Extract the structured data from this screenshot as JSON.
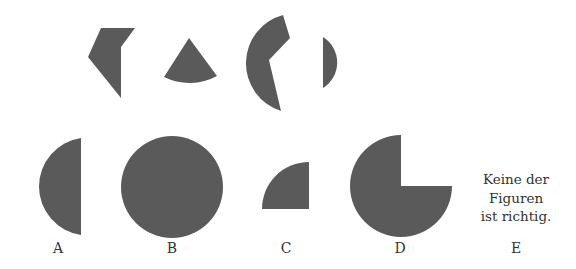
{
  "puzzle": {
    "fill_color": "#5a5a5a",
    "pieces_top": [
      "polygon-piece",
      "sector-piece",
      "crescent-piece",
      "segment-piece"
    ],
    "options": [
      {
        "label": "A",
        "shape": "half-disc"
      },
      {
        "label": "B",
        "shape": "full-circle"
      },
      {
        "label": "C",
        "shape": "quarter-circle"
      },
      {
        "label": "D",
        "shape": "three-quarter-circle"
      },
      {
        "label": "E",
        "text_lines": [
          "Keine der",
          "Figuren",
          "ist richtig."
        ]
      }
    ]
  }
}
